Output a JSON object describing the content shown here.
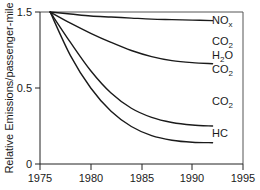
{
  "chart_data": {
    "type": "line",
    "title": "",
    "xlabel": "",
    "ylabel": "Relative Emissions/passenger-mile",
    "xlim": [
      1975,
      1995
    ],
    "ylim": [
      0,
      1.5
    ],
    "xticks": [
      1975,
      1980,
      1985,
      1990,
      1995
    ],
    "yticks": [
      0,
      0.5,
      1.5
    ],
    "ytick_labels": [
      "0",
      "0.5",
      "1.5"
    ],
    "xtick_labels": [
      "1975",
      "1980",
      "1985",
      "1990",
      "1995"
    ],
    "grid": false,
    "legend_position": "right-inline-labels",
    "series": [
      {
        "name": "NOx",
        "label_main": "NO",
        "label_sub": "x",
        "label_x": 212,
        "label_y": 24,
        "x": [
          1976,
          1978,
          1980,
          1982,
          1984,
          1986,
          1988,
          1990,
          1992
        ],
        "values": [
          1.5,
          1.48,
          1.46,
          1.45,
          1.44,
          1.43,
          1.425,
          1.42,
          1.415
        ]
      },
      {
        "name": "CO2-upper",
        "label_main": "CO",
        "label_sub": "2",
        "label_x": 212,
        "label_y": 45,
        "x": [
          1976,
          1978,
          1980,
          1982,
          1984,
          1986,
          1988,
          1990,
          1992
        ],
        "values": [
          1.5,
          1.39,
          1.29,
          1.2,
          1.12,
          1.06,
          1.02,
          1.0,
          0.99
        ]
      },
      {
        "name": "H2O",
        "label_main": "H",
        "label_sub": "2",
        "label_tail": "O",
        "label_x": 212,
        "label_y": 59,
        "x": [],
        "values": []
      },
      {
        "name": "CO2-mid",
        "label_main": "CO",
        "label_sub": "2",
        "label_x": 212,
        "label_y": 73,
        "x": [],
        "values": []
      },
      {
        "name": "CO2-lower",
        "label_main": "CO",
        "label_sub": "2",
        "label_x": 212,
        "label_y": 105,
        "x": [
          1976,
          1978,
          1980,
          1982,
          1984,
          1986,
          1988,
          1990,
          1992
        ],
        "values": [
          1.5,
          1.2,
          0.92,
          0.7,
          0.55,
          0.46,
          0.41,
          0.385,
          0.375
        ]
      },
      {
        "name": "HC",
        "label_main": "HC",
        "label_sub": "",
        "label_x": 212,
        "label_y": 137,
        "x": [
          1976,
          1978,
          1980,
          1982,
          1984,
          1986,
          1988,
          1990,
          1992
        ],
        "values": [
          1.5,
          1.07,
          0.75,
          0.52,
          0.37,
          0.28,
          0.235,
          0.215,
          0.21
        ]
      }
    ]
  },
  "axes": {
    "y_title": "Relative Emissions/passenger-mile",
    "y_tick_1": "1.5",
    "y_tick_2": "0.5",
    "y_tick_3": "0",
    "x_tick_1": "1975",
    "x_tick_2": "1980",
    "x_tick_3": "1985",
    "x_tick_4": "1990",
    "x_tick_5": "1995"
  },
  "labels": {
    "nox_main": "NO",
    "nox_sub": "x",
    "co2_upper_main": "CO",
    "co2_upper_sub": "2",
    "h2o_main": "H",
    "h2o_sub": "2",
    "h2o_tail": "O",
    "co2_mid_main": "CO",
    "co2_mid_sub": "2",
    "co2_lower_main": "CO",
    "co2_lower_sub": "2",
    "hc_main": "HC"
  },
  "colors": {
    "curve": "#1a1a1a",
    "axis": "#222222",
    "frame": "#555555",
    "background": "#ffffff"
  }
}
